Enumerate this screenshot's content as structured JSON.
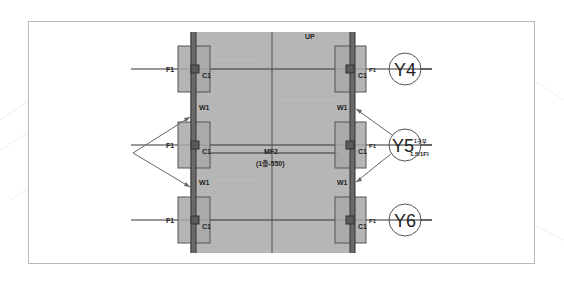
{
  "drawing": {
    "type": "structural plan detail",
    "direction_label": "UP",
    "slab": {
      "label": "MF2",
      "spec": "(1층-550)"
    },
    "grid_axes": [
      {
        "label": "Y4"
      },
      {
        "label": "Y5",
        "annotation_top": "1구부",
        "annotation_bottom": "1.5/1Fl"
      },
      {
        "label": "Y6"
      }
    ],
    "footing_label": "F1",
    "column_label": "C1",
    "wall_label": "W1",
    "colors": {
      "slab_fill": "#b4b4b4",
      "pad_fill": "#a9a9a9",
      "line": "#3a3a3a",
      "frame": "#b9b9b9"
    }
  }
}
